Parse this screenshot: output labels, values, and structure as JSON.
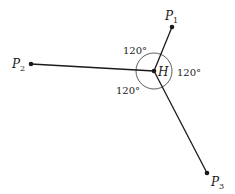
{
  "diagram": {
    "type": "fermat-point",
    "center": {
      "label": "H",
      "x": 154,
      "y": 71
    },
    "points": [
      {
        "name": "P",
        "sub": "1",
        "x": 172,
        "y": 27,
        "lx": 164,
        "ly": 20
      },
      {
        "name": "P",
        "sub": "2",
        "x": 31,
        "y": 64,
        "lx": 12,
        "ly": 68
      },
      {
        "name": "P",
        "sub": "3",
        "x": 207,
        "y": 173,
        "lx": 211,
        "ly": 186
      }
    ],
    "angles": [
      {
        "text": "120°",
        "x": 123,
        "y": 53
      },
      {
        "text": "120°",
        "x": 177,
        "y": 75
      },
      {
        "text": "120°",
        "x": 117,
        "y": 93
      }
    ],
    "circle_radius": 18,
    "line_color": "#1a1a1a"
  }
}
